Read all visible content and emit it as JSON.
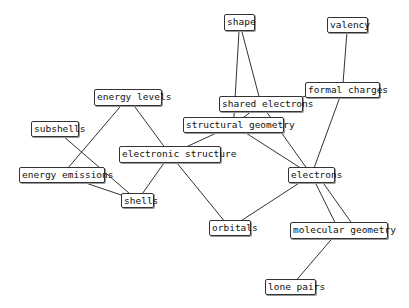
{
  "nodes": [
    {
      "id": "shape",
      "label": "shape",
      "x": 224,
      "y": 14,
      "w": 31,
      "h": 17
    },
    {
      "id": "valency",
      "label": "valency",
      "x": 327,
      "y": 17,
      "w": 41,
      "h": 16
    },
    {
      "id": "formal_charges",
      "label": "formal charges",
      "x": 305,
      "y": 82,
      "w": 75,
      "h": 16
    },
    {
      "id": "shared_electrons",
      "label": "shared electrons",
      "x": 219,
      "y": 96,
      "w": 84,
      "h": 16
    },
    {
      "id": "structural_geometry",
      "label": "structural geometry",
      "x": 183,
      "y": 117,
      "w": 101,
      "h": 16
    },
    {
      "id": "energy_levels",
      "label": "energy levels",
      "x": 94,
      "y": 89,
      "w": 68,
      "h": 17
    },
    {
      "id": "subshells",
      "label": "subshells",
      "x": 31,
      "y": 121,
      "w": 48,
      "h": 16
    },
    {
      "id": "electronic_structure",
      "label": "electronic structure",
      "x": 119,
      "y": 146,
      "w": 102,
      "h": 17
    },
    {
      "id": "energy_emissions",
      "label": "energy emissions",
      "x": 19,
      "y": 167,
      "w": 86,
      "h": 16
    },
    {
      "id": "shells",
      "label": "shells",
      "x": 121,
      "y": 193,
      "w": 33,
      "h": 15
    },
    {
      "id": "electrons",
      "label": "electrons",
      "x": 288,
      "y": 167,
      "w": 47,
      "h": 16
    },
    {
      "id": "orbitals",
      "label": "orbitals",
      "x": 209,
      "y": 220,
      "w": 42,
      "h": 16
    },
    {
      "id": "molecular_geometry",
      "label": "molecular geometry",
      "x": 290,
      "y": 222,
      "w": 98,
      "h": 17
    },
    {
      "id": "lone_pairs",
      "label": "lone pairs",
      "x": 265,
      "y": 279,
      "w": 51,
      "h": 16
    }
  ],
  "edges": [
    [
      "shape",
      "shared_electrons"
    ],
    [
      "shape",
      "structural_geometry"
    ],
    [
      "valency",
      "formal_charges"
    ],
    [
      "formal_charges",
      "electrons"
    ],
    [
      "formal_charges",
      "shared_electrons"
    ],
    [
      "shared_electrons",
      "structural_geometry"
    ],
    [
      "shared_electrons",
      "electrons"
    ],
    [
      "structural_geometry",
      "electronic_structure"
    ],
    [
      "structural_geometry",
      "electrons"
    ],
    [
      "energy_levels",
      "energy_emissions"
    ],
    [
      "energy_levels",
      "electronic_structure"
    ],
    [
      "subshells",
      "shells"
    ],
    [
      "energy_emissions",
      "shells"
    ],
    [
      "electronic_structure",
      "shells"
    ],
    [
      "electronic_structure",
      "orbitals"
    ],
    [
      "electrons",
      "orbitals"
    ],
    [
      "electrons",
      "molecular_geometry"
    ],
    [
      "electrons",
      "molecular_geometry"
    ],
    [
      "molecular_geometry",
      "lone_pairs"
    ]
  ]
}
